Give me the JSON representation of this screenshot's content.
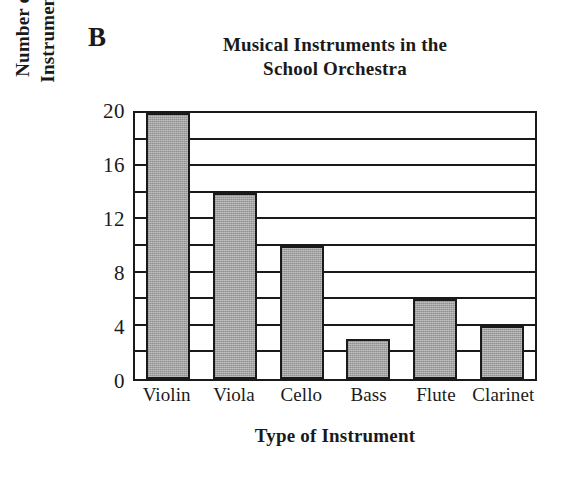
{
  "panel": {
    "label": "B"
  },
  "chart_data": {
    "type": "bar",
    "title": "Musical Instruments in the School Orchestra",
    "title_lines": [
      "Musical Instruments in the",
      "School Orchestra"
    ],
    "xlabel": "Type of Instrument",
    "ylabel": "Number of Instruments",
    "ylabel_lines": [
      "Number of",
      "Instruments"
    ],
    "categories": [
      "Violin",
      "Viola",
      "Cello",
      "Bass",
      "Flute",
      "Clarinet"
    ],
    "values": [
      20,
      14,
      10,
      3,
      6,
      4
    ],
    "ylim": [
      0,
      20
    ],
    "ytick_labels": [
      "0",
      "4",
      "8",
      "12",
      "16",
      "20"
    ],
    "ytick_values": [
      0,
      4,
      8,
      12,
      16,
      20
    ],
    "gridline_values": [
      2,
      4,
      6,
      8,
      10,
      12,
      14,
      16,
      18,
      20
    ],
    "grid": true,
    "legend": false,
    "colors": {
      "bar_fill": "#a3a3a3",
      "bar_stroke": "#1a1a1a",
      "axis": "#1a1a1a",
      "background": "#ffffff",
      "text": "#1a1a1a"
    }
  }
}
